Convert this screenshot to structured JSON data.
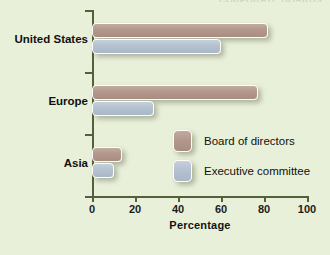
{
  "header": {
    "clipped_top_text": "CORPORATE BOARDS"
  },
  "colors": {
    "background": "#e9f0da",
    "axis": "#555f3c",
    "board_of_directors": "#b3978d",
    "executive_committee": "#b4c1d0",
    "bar_outline": "#fdfdfb",
    "text": "#101010"
  },
  "chart_data": {
    "type": "bar",
    "orientation": "horizontal",
    "title": "",
    "xlabel": "Percentage",
    "ylabel": "",
    "categories": [
      "United States",
      "Europe",
      "Asia"
    ],
    "series": [
      {
        "name": "Board of directors",
        "color": "#b3978d",
        "values": [
          82,
          77,
          14
        ]
      },
      {
        "name": "Executive committee",
        "color": "#b4c1d0",
        "values": [
          60,
          29,
          10
        ]
      }
    ],
    "xlim": [
      0,
      100
    ],
    "xticks": [
      0,
      20,
      40,
      60,
      80,
      100
    ],
    "xtick_labels": [
      "0",
      "20",
      "40",
      "60",
      "80",
      "100"
    ],
    "grid": false,
    "legend_position": "inside-center-right"
  }
}
